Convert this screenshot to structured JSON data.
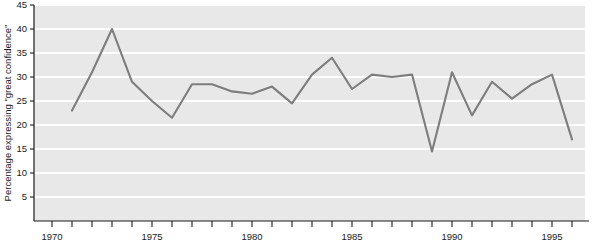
{
  "chart_data": {
    "type": "line",
    "title": "",
    "subtitle": "",
    "xlabel": "",
    "ylabel": "Percentage expressing \"great confidence\"",
    "xlim": [
      1970,
      1996.6
    ],
    "ylim": [
      0,
      45
    ],
    "grid": true,
    "grid_axis": "y",
    "legend": false,
    "legend_position": "none",
    "y_ticks": [
      5,
      10,
      15,
      20,
      25,
      30,
      35,
      40,
      45
    ],
    "y_tick_labels": [
      "5",
      "10",
      "15",
      "20",
      "25",
      "30",
      "35",
      "40",
      "45"
    ],
    "x_ticks": [
      1970,
      1971,
      1972,
      1973,
      1974,
      1975,
      1976,
      1977,
      1978,
      1979,
      1980,
      1981,
      1982,
      1983,
      1984,
      1985,
      1986,
      1987,
      1988,
      1989,
      1990,
      1991,
      1992,
      1993,
      1994,
      1995,
      1996
    ],
    "x_tick_labels": [
      "1970",
      "",
      "",
      "",
      "",
      "1975",
      "",
      "",
      "",
      "",
      "1980",
      "",
      "",
      "",
      "",
      "1985",
      "",
      "",
      "",
      "",
      "1990",
      "",
      "",
      "",
      "",
      "1995",
      ""
    ],
    "x_major_labels": [
      "1970",
      "1975",
      "1980",
      "1985",
      "1990",
      "1995"
    ],
    "series": [
      {
        "name": "Percentage expressing \"great confidence\"",
        "color": "#7d7d7d",
        "x": [
          1971,
          1972,
          1973,
          1974,
          1975,
          1976,
          1977,
          1978,
          1979,
          1980,
          1981,
          1982,
          1983,
          1984,
          1985,
          1986,
          1987,
          1988,
          1989,
          1990,
          1991,
          1992,
          1993,
          1994,
          1995,
          1996
        ],
        "values": [
          23,
          31,
          40,
          29,
          25,
          21.5,
          28.5,
          28.5,
          27,
          26.5,
          28,
          24.5,
          30.5,
          34,
          27.5,
          30.5,
          30,
          30.5,
          14.5,
          31,
          22,
          29,
          25.5,
          28.5,
          30.5,
          17
        ]
      }
    ],
    "colors": {
      "line": "#7d7d7d",
      "plot_background": "#e8e8e8",
      "gridline": "#ffffff",
      "axis": "#1a1a1a",
      "text": "#1a1a1a"
    }
  }
}
